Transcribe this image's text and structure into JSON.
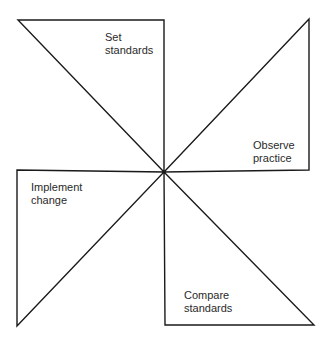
{
  "diagram": {
    "type": "pinwheel-cycle",
    "stroke_color": "#1a1a1a",
    "background": "#ffffff",
    "center": [
      164,
      172
    ],
    "blades": [
      {
        "id": "set-standards",
        "position": "top-left",
        "line1": "Set",
        "line2": "standards",
        "points": "18,20 164,20 164,172"
      },
      {
        "id": "observe-practice",
        "position": "top-right",
        "line1": "Observe",
        "line2": "practice",
        "points": "309,19 309,170 164,172"
      },
      {
        "id": "implement-change",
        "position": "bottom-left",
        "line1": "Implement",
        "line2": "change",
        "points": "17,170 164,172 17,326"
      },
      {
        "id": "compare-standards",
        "position": "bottom-right",
        "line1": "Compare",
        "line2": "standards",
        "points": "164,172 314,325 165,325"
      }
    ]
  }
}
